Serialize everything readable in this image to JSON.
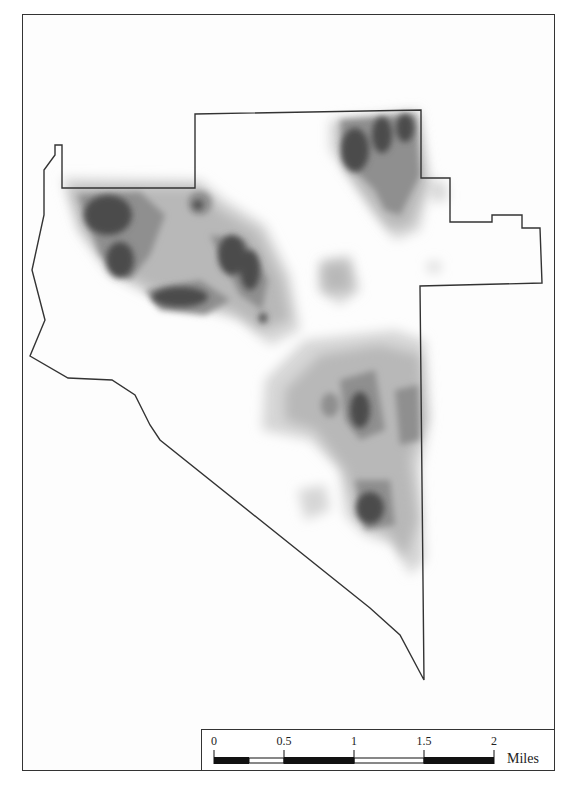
{
  "map": {
    "type": "kernel density heat map",
    "shading": [
      "#e4e4e4",
      "#c9c9c9",
      "#aaaaaa",
      "#888888",
      "#5f5f5f",
      "#3a3a3a"
    ],
    "boundary_color": "#333333"
  },
  "scale_bar": {
    "ticks": [
      "0",
      "0.5",
      "1",
      "1.5",
      "2"
    ],
    "units": "Miles"
  }
}
